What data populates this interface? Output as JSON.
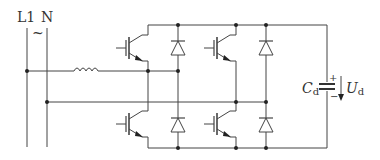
{
  "diagram": {
    "type": "circuit",
    "line_color": "#444444",
    "labels": {
      "line": "L1",
      "neutral": "N",
      "ac_symbol": "~",
      "capacitor_main": "C",
      "capacitor_sub": "d",
      "voltage_main": "U",
      "voltage_sub": "d",
      "plus": "+",
      "minus": "−"
    },
    "components": [
      {
        "id": "inductor",
        "type": "inductor"
      },
      {
        "id": "igbt-top-left",
        "type": "igbt"
      },
      {
        "id": "igbt-bottom-left",
        "type": "igbt"
      },
      {
        "id": "igbt-top-right",
        "type": "igbt"
      },
      {
        "id": "igbt-bottom-right",
        "type": "igbt"
      },
      {
        "id": "diode-top-left",
        "type": "diode"
      },
      {
        "id": "diode-bottom-left",
        "type": "diode"
      },
      {
        "id": "diode-top-right",
        "type": "diode"
      },
      {
        "id": "diode-bottom-right",
        "type": "diode"
      },
      {
        "id": "capacitor",
        "type": "capacitor"
      }
    ]
  }
}
